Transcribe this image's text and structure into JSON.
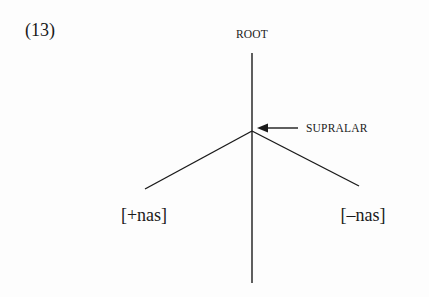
{
  "example": {
    "number": "(13)"
  },
  "tree": {
    "root_label": "ROOT",
    "node_label": "SUPRALAR",
    "node_pointer": "arrow-left",
    "branches": [
      {
        "label": "[+nas]",
        "side": "left"
      },
      {
        "label": "[–nas]",
        "side": "right"
      }
    ]
  },
  "colors": {
    "ink": "#1a1a1a",
    "background": "#fdfdfd"
  }
}
